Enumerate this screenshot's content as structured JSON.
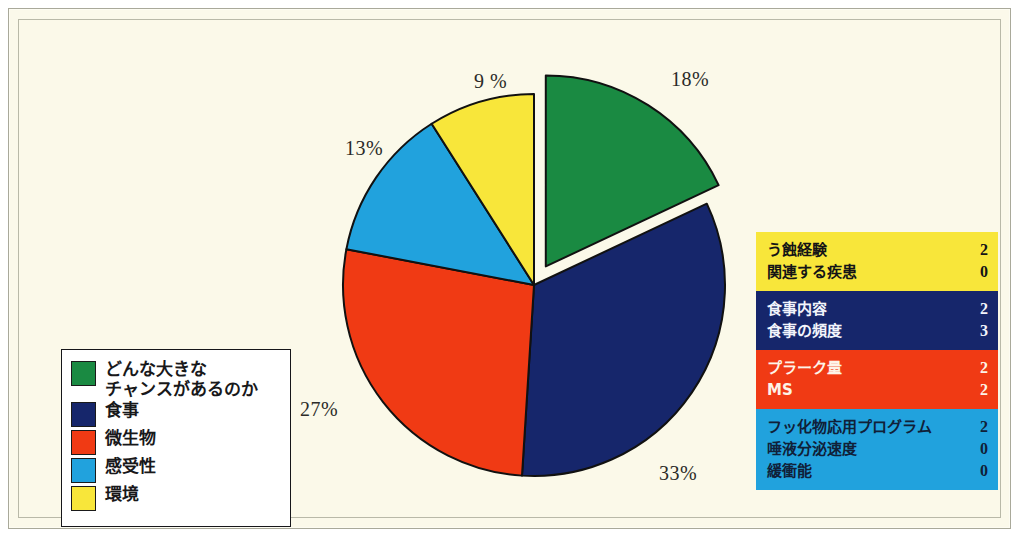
{
  "colors": {
    "background": "#fbf9e9",
    "green": "#1a8a42",
    "navy": "#16266b",
    "red": "#f03a14",
    "blue": "#21a2dd",
    "yellow": "#f8e63a",
    "outline": "#111111",
    "legend_bg": "#ffffff",
    "text_dark": "#18181a",
    "text_light": "#ffffff"
  },
  "chart_data": {
    "type": "pie",
    "title": "",
    "categories": [
      "どんな大きな\nチャンスがあるのか",
      "食事",
      "微生物",
      "感受性",
      "環境"
    ],
    "values": [
      18,
      33,
      27,
      13,
      9
    ],
    "value_labels": [
      "18%",
      "33%",
      "27%",
      "13%",
      "9 %"
    ],
    "slice_colors": [
      "#1a8a42",
      "#16266b",
      "#f03a14",
      "#21a2dd",
      "#f8e63a"
    ],
    "exploded": [
      true,
      false,
      false,
      false,
      false
    ],
    "legend_position": "bottom-left",
    "grid": false
  },
  "legend": {
    "items": [
      {
        "label": "どんな大きな\nチャンスがあるのか",
        "color": "#1a8a42",
        "swatch_name": "legend-swatch-green"
      },
      {
        "label": "食事",
        "color": "#16266b",
        "swatch_name": "legend-swatch-navy"
      },
      {
        "label": "微生物",
        "color": "#f03a14",
        "swatch_name": "legend-swatch-red"
      },
      {
        "label": "感受性",
        "color": "#21a2dd",
        "swatch_name": "legend-swatch-blue"
      },
      {
        "label": "環境",
        "color": "#f8e63a",
        "swatch_name": "legend-swatch-yellow"
      }
    ]
  },
  "blocks": [
    {
      "name": "block-yellow",
      "bg": "#f8e63a",
      "fg": "#141416",
      "rows": [
        {
          "label": "う蝕経験",
          "value": "2"
        },
        {
          "label": "関連する疾患",
          "value": "0"
        }
      ]
    },
    {
      "name": "block-navy",
      "bg": "#16266b",
      "fg": "#f2f4fb",
      "rows": [
        {
          "label": "食事内容",
          "value": "2"
        },
        {
          "label": "食事の頻度",
          "value": "3"
        }
      ]
    },
    {
      "name": "block-red",
      "bg": "#f03a14",
      "fg": "#fdf4e8",
      "rows": [
        {
          "label": "プラーク量",
          "value": "2"
        },
        {
          "label": "MS",
          "value": "2"
        }
      ]
    },
    {
      "name": "block-blue",
      "bg": "#21a2dd",
      "fg": "#102038",
      "rows": [
        {
          "label": "フッ化物応用プログラム",
          "value": "2"
        },
        {
          "label": "唾液分泌速度",
          "value": "0"
        },
        {
          "label": "緩衝能",
          "value": "0"
        }
      ]
    }
  ],
  "pct_labels": [
    {
      "text": "18%",
      "left": 652,
      "top": 48
    },
    {
      "text": "9 %",
      "left": 455,
      "top": 50
    },
    {
      "text": "13%",
      "left": 326,
      "top": 117
    },
    {
      "text": "27%",
      "left": 281,
      "top": 378
    },
    {
      "text": "33%",
      "left": 640,
      "top": 442
    }
  ]
}
